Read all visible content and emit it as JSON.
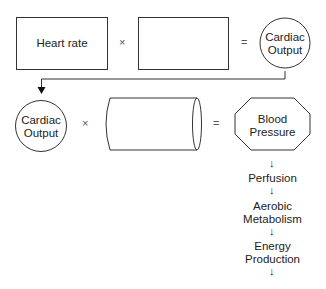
{
  "row1": {
    "box1_label": "Heart rate",
    "box2_label": "",
    "times": "×",
    "equals": "=",
    "result_line1": "Cardiac",
    "result_line2": "Output"
  },
  "row2": {
    "input_line1": "Cardiac",
    "input_line2": "Output",
    "times": "×",
    "cylinder_label": "",
    "equals": "=",
    "result_line1": "Blood",
    "result_line2": "Pressure"
  },
  "chain": {
    "arrow": "↓",
    "steps": [
      {
        "line1": "Perfusion",
        "line2": ""
      },
      {
        "line1": "Aerobic",
        "line2": "Metabolism"
      },
      {
        "line1": "Energy",
        "line2": "Production"
      }
    ]
  }
}
